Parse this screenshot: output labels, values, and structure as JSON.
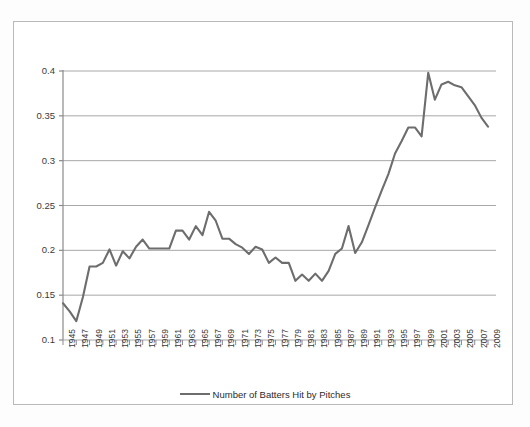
{
  "chart_data": {
    "type": "line",
    "title": "",
    "xlabel": "",
    "ylabel": "",
    "xlim": [
      1945,
      2009
    ],
    "ylim": [
      0.1,
      0.4
    ],
    "yticks": [
      0.1,
      0.15,
      0.2,
      0.25,
      0.3,
      0.35,
      0.4
    ],
    "ytick_labels": [
      "0.1",
      "0.15",
      "0.2",
      "0.25",
      "0.3",
      "0.35",
      "0.4"
    ],
    "grid": true,
    "grid_axis": "y",
    "legend_position": "bottom",
    "line_color": "#6d6d6d",
    "xtick_labels": [
      "1945",
      "1947",
      "1949",
      "1951",
      "1953",
      "1955",
      "1957",
      "1959",
      "1961",
      "1963",
      "1965",
      "1967",
      "1969",
      "1971",
      "1973",
      "1975",
      "1977",
      "1979",
      "1981",
      "1983",
      "1985",
      "1987",
      "1989",
      "1991",
      "1993",
      "1995",
      "1997",
      "1999",
      "2001",
      "2003",
      "2005",
      "2007",
      "2009"
    ],
    "xtick_label_interval": 2,
    "x": [
      1945,
      1946,
      1947,
      1948,
      1949,
      1950,
      1951,
      1952,
      1953,
      1954,
      1955,
      1956,
      1957,
      1958,
      1959,
      1960,
      1961,
      1962,
      1963,
      1964,
      1965,
      1966,
      1967,
      1968,
      1969,
      1970,
      1971,
      1972,
      1973,
      1974,
      1975,
      1976,
      1977,
      1978,
      1979,
      1980,
      1981,
      1982,
      1983,
      1984,
      1985,
      1986,
      1987,
      1988,
      1989,
      1990,
      1991,
      1992,
      1993,
      1994,
      1995,
      1996,
      1997,
      1998,
      1999,
      2000,
      2001,
      2002,
      2003,
      2004,
      2005,
      2006,
      2007,
      2008,
      2009
    ],
    "series": [
      {
        "name": "Number of Batters Hit by Pitches",
        "values": [
          0.141,
          0.132,
          0.121,
          0.148,
          0.182,
          0.182,
          0.186,
          0.201,
          0.183,
          0.199,
          0.191,
          0.204,
          0.212,
          0.202,
          0.202,
          0.202,
          0.202,
          0.222,
          0.222,
          0.212,
          0.227,
          0.217,
          0.243,
          0.233,
          0.213,
          0.213,
          0.207,
          0.203,
          0.196,
          0.204,
          0.201,
          0.186,
          0.192,
          0.186,
          0.186,
          0.166,
          0.173,
          0.166,
          0.174,
          0.166,
          0.177,
          0.196,
          0.202,
          0.227,
          0.197,
          0.209,
          0.228,
          0.248,
          0.267,
          0.285,
          0.308,
          0.322,
          0.337,
          0.337,
          0.327,
          0.398,
          0.368,
          0.385,
          0.388,
          0.384,
          0.382,
          0.372,
          0.362,
          0.348,
          0.338
        ]
      }
    ]
  },
  "legend": {
    "label": "Number of Batters Hit by Pitches"
  }
}
